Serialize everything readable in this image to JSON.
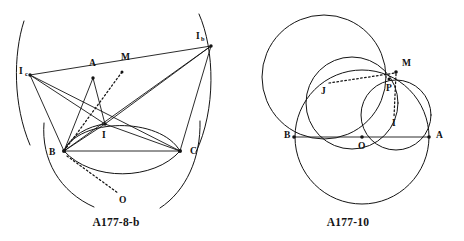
{
  "page": {
    "width": 464,
    "height": 241,
    "background": "#ffffff",
    "ink_color": "#141414"
  },
  "figures": [
    {
      "id": "A177-8-b",
      "caption": "A177-8-b",
      "description": "Triangle ABC with incenter I, excenters Ib and Ic, midpoint M and circumcenter O",
      "points": [
        {
          "name": "Ic",
          "base": "I",
          "sub": "c",
          "x": 30,
          "y": 75,
          "label_x": 19,
          "label_y": 72,
          "dot": true
        },
        {
          "name": "Ib",
          "base": "I",
          "sub": "b",
          "x": 211,
          "y": 46,
          "label_x": 196,
          "label_y": 37,
          "dot": true
        },
        {
          "name": "A",
          "base": "A",
          "sub": "",
          "x": 93,
          "y": 78,
          "label_x": 89,
          "label_y": 64,
          "dot": true
        },
        {
          "name": "M",
          "base": "M",
          "sub": "",
          "x": 122,
          "y": 72,
          "label_x": 122,
          "label_y": 58,
          "dot": true
        },
        {
          "name": "I",
          "base": "I",
          "sub": "",
          "x": 105,
          "y": 124,
          "label_x": 103,
          "label_y": 136,
          "dot": true
        },
        {
          "name": "B",
          "base": "B",
          "sub": "",
          "x": 64,
          "y": 151,
          "label_x": 50,
          "label_y": 153,
          "dot": true
        },
        {
          "name": "C",
          "base": "C",
          "sub": "",
          "x": 180,
          "y": 151,
          "label_x": 191,
          "label_y": 152,
          "dot": true
        },
        {
          "name": "O",
          "base": "O",
          "sub": "",
          "x": 119,
          "y": 195,
          "label_x": 121,
          "label_y": 201,
          "dot": false
        }
      ],
      "segments": [
        {
          "name": "segment-Ic-Ib",
          "from": "Ic",
          "to": "Ib",
          "style": "solid"
        },
        {
          "name": "segment-Ic-B",
          "from": "Ic",
          "to": "B",
          "style": "solid"
        },
        {
          "name": "segment-Ic-C",
          "from": "Ic",
          "to": "C",
          "style": "solid"
        },
        {
          "name": "segment-Ic-I",
          "from": "Ic",
          "to": "I",
          "style": "solid"
        },
        {
          "name": "segment-Ib-B",
          "from": "Ib",
          "to": "B",
          "style": "solid"
        },
        {
          "name": "segment-Ib-C",
          "from": "Ib",
          "to": "C",
          "style": "solid"
        },
        {
          "name": "segment-Ib-I",
          "from": "Ib",
          "to": "I",
          "style": "solid"
        },
        {
          "name": "segment-A-B",
          "from": "A",
          "to": "B",
          "style": "solid"
        },
        {
          "name": "segment-A-I",
          "from": "A",
          "to": "I",
          "style": "solid"
        },
        {
          "name": "segment-B-C",
          "from": "B",
          "to": "C",
          "style": "solid"
        },
        {
          "name": "segment-B-I",
          "from": "B",
          "to": "I",
          "style": "solid"
        },
        {
          "name": "segment-I-C",
          "from": "I",
          "to": "C",
          "style": "solid"
        },
        {
          "name": "segment-M-B-dashed",
          "from": "M",
          "to": "B",
          "style": "dashed"
        },
        {
          "name": "segment-B-O-dashed",
          "from": "B",
          "to": "O",
          "style": "dashed"
        }
      ],
      "arcs": [
        {
          "name": "arc-circumcircle-left",
          "d": "M 24 21 C 13 55, 13 105, 30 145"
        },
        {
          "name": "arc-circumcircle-right",
          "d": "M 199 14 C 215 50, 216 110, 196 152"
        },
        {
          "name": "arc-through-B-lower",
          "d": "M 44 123 C 41 160, 60 192, 94 207"
        },
        {
          "name": "arc-through-C-lower",
          "d": "M 200 121 C 201 158, 186 191, 160 208"
        },
        {
          "name": "arc-BC-upper",
          "d": "M 64 151 C 78 118, 160 116, 180 151"
        },
        {
          "name": "arc-BC-lower",
          "d": "M 64 151 C 92 182, 154 181, 180 151"
        },
        {
          "name": "arc-BI-short",
          "d": "M 64 151 C 70 135, 88 126, 105 124"
        }
      ]
    },
    {
      "id": "A177-10",
      "caption": "A177-10",
      "description": "Four intersecting circles on diameter BA with points O, M, P, I, J",
      "points": [
        {
          "name": "M",
          "base": "M",
          "sub": "",
          "x": 396,
          "y": 72,
          "label_x": 404,
          "label_y": 64,
          "dot": true
        },
        {
          "name": "P",
          "base": "P",
          "sub": "",
          "x": 389,
          "y": 79,
          "label_x": 388,
          "label_y": 89,
          "dot": true
        },
        {
          "name": "J",
          "base": "J",
          "sub": "",
          "x": 328,
          "y": 82,
          "label_x": 324,
          "label_y": 92,
          "dot": false
        },
        {
          "name": "I",
          "base": "I",
          "sub": "",
          "x": 395,
          "y": 118,
          "label_x": 394,
          "label_y": 124,
          "dot": false
        },
        {
          "name": "B",
          "base": "B",
          "sub": "",
          "x": 294,
          "y": 137,
          "label_x": 286,
          "label_y": 136,
          "dot": true
        },
        {
          "name": "O",
          "base": "O",
          "sub": "",
          "x": 362,
          "y": 137,
          "label_x": 360,
          "label_y": 147,
          "dot": true
        },
        {
          "name": "A",
          "base": "A",
          "sub": "",
          "x": 429,
          "y": 137,
          "label_x": 437,
          "label_y": 136,
          "dot": true
        }
      ],
      "segments": [
        {
          "name": "segment-B-A-diameter",
          "from": "B",
          "to": "A",
          "style": "solid"
        },
        {
          "name": "segment-J-M-dashed",
          "from": "J",
          "to": "M",
          "style": "dashed"
        },
        {
          "name": "segment-M-I-dashed",
          "from": "M",
          "to": "I",
          "style": "dashed"
        }
      ],
      "circles": [
        {
          "name": "circle-large-BA",
          "cx": 362,
          "cy": 137,
          "r": 67
        },
        {
          "name": "circle-upper-left",
          "cx": 324,
          "cy": 77,
          "r": 62
        },
        {
          "name": "circle-middle",
          "cx": 352,
          "cy": 103,
          "r": 46
        },
        {
          "name": "circle-right",
          "cx": 396,
          "cy": 115,
          "r": 35
        }
      ]
    }
  ]
}
